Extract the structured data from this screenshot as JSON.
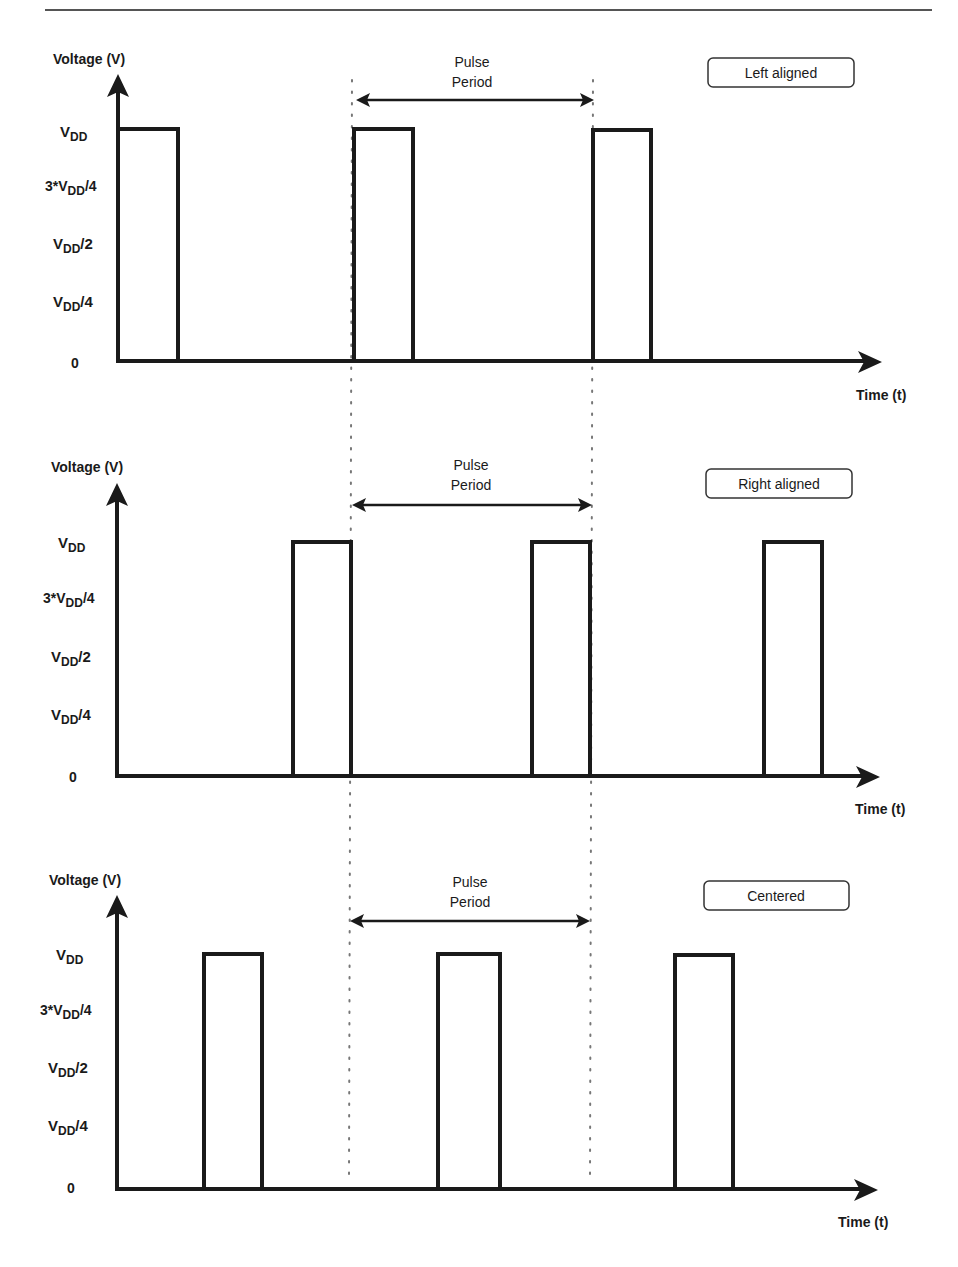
{
  "figure": {
    "top_rule": true
  },
  "common": {
    "y_axis_label": "Voltage (V)",
    "x_axis_label": "Time (t)",
    "pulse_period_label_line1": "Pulse",
    "pulse_period_label_line2": "Period",
    "y_ticks": [
      {
        "main": "V",
        "sub": "DD",
        "suffix": "",
        "prefix": ""
      },
      {
        "main": "V",
        "sub": "DD",
        "suffix": "/4",
        "prefix": "3*"
      },
      {
        "main": "V",
        "sub": "DD",
        "suffix": "/2",
        "prefix": ""
      },
      {
        "main": "V",
        "sub": "DD",
        "suffix": "/4",
        "prefix": ""
      },
      {
        "main": "0",
        "sub": "",
        "suffix": "",
        "prefix": ""
      }
    ]
  },
  "panels": [
    {
      "mode_label": "Left aligned",
      "y_ticks_text": [
        "VDD",
        "3*VDD/4",
        "VDD/2",
        "VDD/4",
        "0"
      ],
      "pulses_x": [
        [
          117,
          178
        ],
        [
          353,
          413
        ],
        [
          593,
          651
        ]
      ]
    },
    {
      "mode_label": "Right aligned",
      "y_ticks_text": [
        "VDD",
        "3*VDD/4",
        "VDD/2",
        "VDD/4",
        "0"
      ],
      "pulses_x": [
        [
          292,
          351
        ],
        [
          531,
          590
        ],
        [
          763,
          822
        ]
      ]
    },
    {
      "mode_label": "Centered",
      "y_ticks_text": [
        "VDD",
        "3*VDD/4",
        "VDD/2",
        "VDD/4",
        "0"
      ],
      "pulses_x": [
        [
          203,
          262
        ],
        [
          438,
          498
        ],
        [
          674,
          733
        ]
      ]
    }
  ],
  "colors": {
    "ink": "#1a1a1a",
    "dotted": "#777777",
    "rule": "#555555"
  }
}
